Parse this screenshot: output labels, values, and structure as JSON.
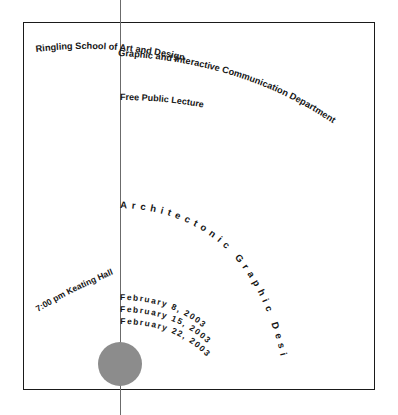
{
  "poster": {
    "institution": "Ringling School of Art and Design",
    "department": "Graphic and Interactive Communication Department",
    "admission": "Free Public Lecture",
    "series_title": "Architectonic Graphic Design",
    "venue": "7:00 pm Keating Hall",
    "dates": [
      "February 8, 2003",
      "February 15, 2003",
      "February 22, 2003"
    ],
    "marks": {
      "circle": "gray-circle-mark",
      "vertical_rule": "vertical-rule",
      "frame": "poster-border"
    },
    "colors": {
      "ink": "#161616",
      "rule": "#6b6b6b",
      "circle": "#8c8c8c",
      "background": "#ffffff",
      "frame": "#1a1a1a"
    }
  }
}
